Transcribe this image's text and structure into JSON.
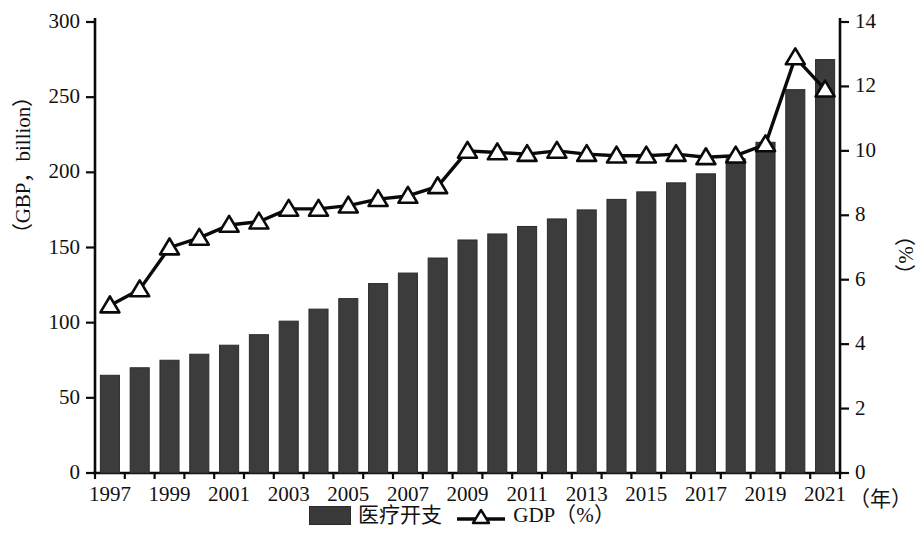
{
  "chart_data": {
    "type": "bar",
    "title": "",
    "xlabel": "（年）",
    "x_unit": "（年）",
    "ylabel": "（GBP，billion）",
    "ylabel_right": "（%）",
    "ylim": [
      0,
      300
    ],
    "ylim_right": [
      0,
      14
    ],
    "grid": false,
    "legend_position": "bottom",
    "categories": [
      "1997",
      "1998",
      "1999",
      "2000",
      "2001",
      "2002",
      "2003",
      "2004",
      "2005",
      "2006",
      "2007",
      "2008",
      "2009",
      "2010",
      "2011",
      "2012",
      "2013",
      "2014",
      "2015",
      "2016",
      "2017",
      "2018",
      "2019",
      "2020",
      "2021"
    ],
    "x_tick_labels": [
      "1997",
      "1999",
      "2001",
      "2003",
      "2005",
      "2007",
      "2009",
      "2011",
      "2013",
      "2015",
      "2017",
      "2019",
      "2021"
    ],
    "y_tick_labels_left": [
      "300",
      "250",
      "200",
      "150",
      "100",
      "50",
      "0"
    ],
    "y_tick_values_left": [
      300,
      250,
      200,
      150,
      100,
      50,
      0
    ],
    "y_tick_labels_right": [
      "14",
      "12",
      "10",
      "8",
      "6",
      "4",
      "2",
      "0"
    ],
    "y_tick_values_right": [
      14,
      12,
      10,
      8,
      6,
      4,
      2,
      0
    ],
    "series": [
      {
        "name": "医疗开支",
        "type": "bar",
        "axis": "left",
        "unit": "GBP, billion",
        "color": "#3c3c3c",
        "values": [
          65,
          70,
          75,
          79,
          85,
          92,
          101,
          109,
          116,
          126,
          133,
          143,
          155,
          159,
          164,
          169,
          175,
          182,
          187,
          193,
          199,
          209,
          220,
          255,
          275
        ]
      },
      {
        "name": "GDP（%）",
        "type": "line",
        "axis": "right",
        "unit": "%",
        "color": "#0a0a0a",
        "marker": "triangle-up",
        "values": [
          5.2,
          5.7,
          7.0,
          7.3,
          7.7,
          7.8,
          8.2,
          8.2,
          8.3,
          8.5,
          8.6,
          8.9,
          10.0,
          9.95,
          9.9,
          10.0,
          9.9,
          9.85,
          9.85,
          9.9,
          9.8,
          9.85,
          10.2,
          12.9,
          11.9
        ]
      }
    ]
  },
  "axis": {
    "left_title": "（GBP，billion）",
    "right_title": "（%）",
    "x_unit_label": "（年）"
  },
  "legend": {
    "items": [
      {
        "label": "医疗开支",
        "marker": "bar-swatch"
      },
      {
        "label": "GDP（%）",
        "marker": "line-triangle-swatch"
      }
    ]
  }
}
